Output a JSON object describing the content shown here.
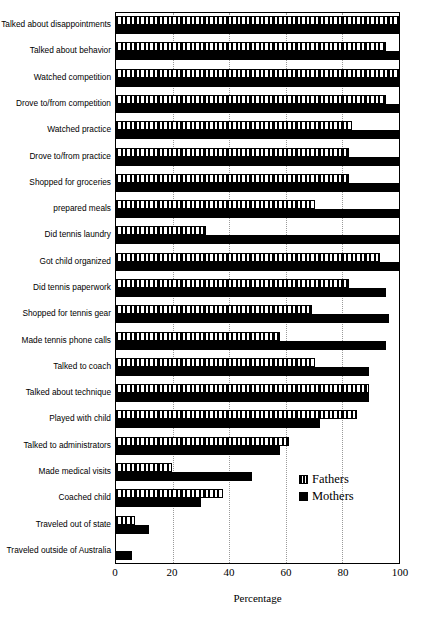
{
  "chart_data": {
    "type": "bar",
    "orientation": "horizontal",
    "title": "",
    "xlabel": "Percentage",
    "ylabel": "",
    "xlim": [
      0,
      100
    ],
    "xticks": [
      0,
      20,
      40,
      60,
      80,
      100
    ],
    "grid": "vertical-dotted",
    "legend_position": "inside-lower-right",
    "categories": [
      "Talked about disappointments",
      "Talked about behavior",
      "Watched competition",
      "Drove to/from competition",
      "Watched practice",
      "Drove to/from practice",
      "Shopped for groceries",
      "prepared meals",
      "Did tennis laundry",
      "Got child organized",
      "Did tennis paperwork",
      "Shopped for tennis gear",
      "Made tennis phone calls",
      "Talked to coach",
      "Talked about technique",
      "Played with child",
      "Talked to administrators",
      "Made medical visits",
      "Coached child",
      "Traveled out of state",
      "Traveled outside of Australia"
    ],
    "series": [
      {
        "name": "Fathers",
        "color": "#ffffff",
        "pattern": "vertical-hatch",
        "values": [
          100,
          95,
          100,
          95,
          83,
          82,
          82,
          70,
          32,
          93,
          82,
          69,
          58,
          70,
          89,
          85,
          61,
          20,
          38,
          7,
          0
        ]
      },
      {
        "name": "Mothers",
        "color": "#000000",
        "pattern": "solid",
        "values": [
          100,
          100,
          100,
          100,
          100,
          100,
          100,
          100,
          100,
          100,
          95,
          96,
          95,
          89,
          89,
          72,
          58,
          48,
          30,
          12,
          6
        ]
      }
    ]
  },
  "legend": {
    "items": [
      {
        "label": "Fathers",
        "swatch": "hatched-square-icon"
      },
      {
        "label": "Mothers",
        "swatch": "filled-square-icon"
      }
    ]
  },
  "axis": {
    "x_title": "Percentage",
    "x_tick_labels": [
      "0",
      "20",
      "40",
      "60",
      "80",
      "100"
    ]
  }
}
